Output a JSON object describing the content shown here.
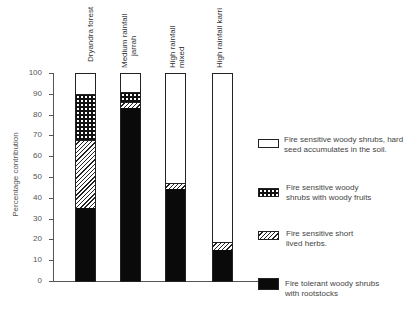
{
  "chart_data": {
    "type": "bar",
    "stacked": true,
    "title": "",
    "xlabel": "",
    "ylabel": "Percentage contribution",
    "ylim": [
      0,
      100
    ],
    "yticks": [
      0,
      10,
      20,
      30,
      40,
      50,
      60,
      70,
      80,
      90,
      100
    ],
    "grid": false,
    "legend_position": "right",
    "categories": [
      "Dryandra forest",
      "Medium rainfall jarrah",
      "High rainfall mixed",
      "High rainfall karri"
    ],
    "series": [
      {
        "name": "Fire tolerant woody shrubs with rootstocks",
        "pattern": "solid-black",
        "values": [
          35,
          83,
          44,
          15
        ]
      },
      {
        "name": "Fire sensitive short lived herbs.",
        "pattern": "diagonal-hatch",
        "values": [
          33,
          3,
          3,
          4
        ]
      },
      {
        "name": "Fire sensitive woody shrubs with woody fruits",
        "pattern": "cross-hatch",
        "values": [
          22,
          5,
          0,
          0
        ]
      },
      {
        "name": "Fire sensitive woody shrubs, hard seed accumulates in the soil.",
        "pattern": "white",
        "values": [
          10,
          9,
          53,
          81
        ]
      }
    ]
  },
  "axis": {
    "ylabel": "Percentage contribution",
    "ticks": [
      "0",
      "10",
      "20",
      "30",
      "40",
      "50",
      "60",
      "70",
      "80",
      "90",
      "100"
    ]
  },
  "categories": [
    {
      "line1": "Dryandra forest",
      "line2": ""
    },
    {
      "line1": "Medium rainfall",
      "line2": "jarrah"
    },
    {
      "line1": "High rainfall",
      "line2": "mixed"
    },
    {
      "line1": "High rainfall karri",
      "line2": ""
    }
  ],
  "legend": [
    {
      "line1": "Fire sensitive woody shrubs, hard",
      "line2": "seed accumulates in the soil."
    },
    {
      "line1": "Fire sensitive woody",
      "line2": "shrubs with woody fruits"
    },
    {
      "line1": "Fire sensitive short",
      "line2": "lived herbs."
    },
    {
      "line1": "Fire tolerant woody shrubs",
      "line2": "with rootstocks"
    }
  ]
}
